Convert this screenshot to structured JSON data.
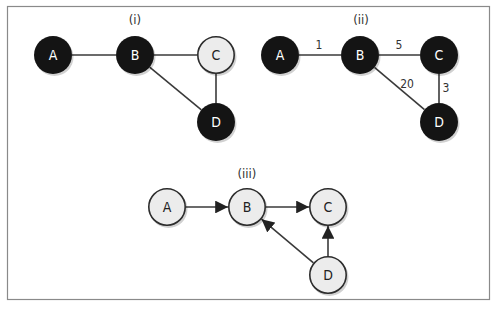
{
  "figure": {
    "panels": [
      {
        "id": "i",
        "title": "(i)",
        "title_pos": [
          135,
          24
        ],
        "directed": false,
        "nodes": [
          {
            "id": "A",
            "label": "A",
            "x": 53,
            "y": 55,
            "style": "dark"
          },
          {
            "id": "B",
            "label": "B",
            "x": 135,
            "y": 55,
            "style": "dark"
          },
          {
            "id": "C",
            "label": "C",
            "x": 216,
            "y": 55,
            "style": "light"
          },
          {
            "id": "D",
            "label": "D",
            "x": 216,
            "y": 122,
            "style": "dark"
          }
        ],
        "edges": [
          {
            "from": "A",
            "to": "B"
          },
          {
            "from": "B",
            "to": "C"
          },
          {
            "from": "B",
            "to": "D"
          },
          {
            "from": "C",
            "to": "D"
          }
        ]
      },
      {
        "id": "ii",
        "title": "(ii)",
        "title_pos": [
          361,
          24
        ],
        "directed": false,
        "nodes": [
          {
            "id": "A",
            "label": "A",
            "x": 280,
            "y": 55,
            "style": "dark"
          },
          {
            "id": "B",
            "label": "B",
            "x": 360,
            "y": 55,
            "style": "dark"
          },
          {
            "id": "C",
            "label": "C",
            "x": 439,
            "y": 55,
            "style": "dark"
          },
          {
            "id": "D",
            "label": "D",
            "x": 439,
            "y": 122,
            "style": "dark"
          }
        ],
        "edges": [
          {
            "from": "A",
            "to": "B",
            "weight": "1",
            "label_pos": [
              319,
              49
            ]
          },
          {
            "from": "B",
            "to": "C",
            "weight": "5",
            "label_pos": [
              399,
              49
            ]
          },
          {
            "from": "B",
            "to": "D",
            "weight": "20",
            "label_pos": [
              407,
              88
            ]
          },
          {
            "from": "C",
            "to": "D",
            "weight": "3",
            "label_pos": [
              446,
              92
            ]
          }
        ]
      },
      {
        "id": "iii",
        "title": "(iii)",
        "title_pos": [
          247,
          178
        ],
        "directed": true,
        "nodes": [
          {
            "id": "A",
            "label": "A",
            "x": 167,
            "y": 207,
            "style": "light"
          },
          {
            "id": "B",
            "label": "B",
            "x": 247,
            "y": 207,
            "style": "light"
          },
          {
            "id": "C",
            "label": "C",
            "x": 328,
            "y": 207,
            "style": "light"
          },
          {
            "id": "D",
            "label": "D",
            "x": 328,
            "y": 275,
            "style": "light"
          }
        ],
        "edges": [
          {
            "from": "A",
            "to": "B"
          },
          {
            "from": "B",
            "to": "C"
          },
          {
            "from": "D",
            "to": "B"
          },
          {
            "from": "D",
            "to": "C"
          }
        ]
      }
    ],
    "node_radius": 19,
    "colors": {
      "dark_node": "#141414",
      "light_node": "#ececec",
      "edge": "#3a3a3a",
      "frame": "#8a8a8a"
    }
  }
}
